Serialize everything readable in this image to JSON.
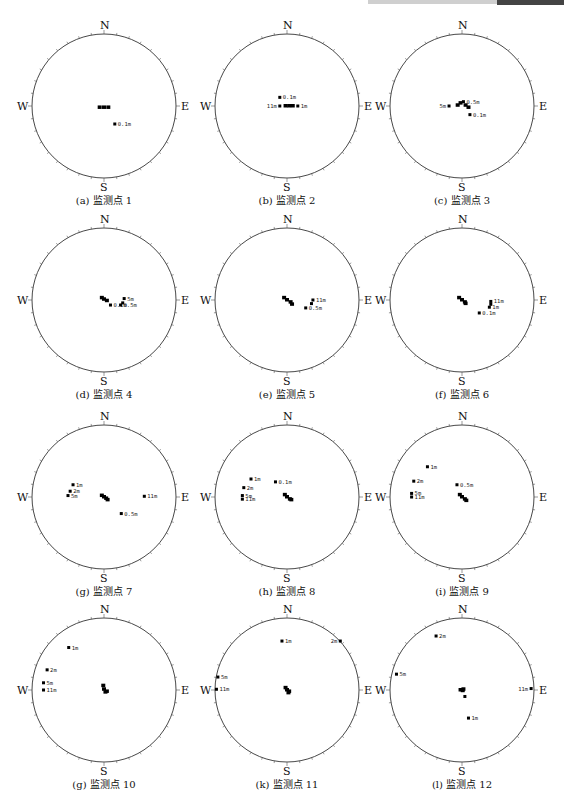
{
  "header": {
    "decoration": "chapter-header-bar"
  },
  "chart_data": [
    {
      "type": "scatter",
      "title": "(a) 监测点 1",
      "subplot": "a",
      "compass": [
        "N",
        "E",
        "S",
        "W"
      ],
      "cluster": [
        [
          -0.06,
          -0.02
        ],
        [
          0.0,
          -0.02
        ],
        [
          0.06,
          -0.02
        ]
      ],
      "points": [
        {
          "label": "0.1m",
          "x": 0.15,
          "y": -0.25
        }
      ]
    },
    {
      "type": "scatter",
      "title": "(b) 监测点 2",
      "subplot": "b",
      "compass": [
        "N",
        "E",
        "S",
        "W"
      ],
      "cluster": [
        [
          -0.02,
          0.0
        ],
        [
          0.03,
          0.0
        ],
        [
          0.08,
          0.0
        ]
      ],
      "points": [
        {
          "label": "0.1m",
          "x": -0.1,
          "y": 0.12
        },
        {
          "label": "11m",
          "x": -0.1,
          "y": 0.0,
          "anchor": "left"
        },
        {
          "label": "1m",
          "x": 0.15,
          "y": 0.0
        }
      ]
    },
    {
      "type": "scatter",
      "title": "(c) 监测点 3",
      "subplot": "c",
      "compass": [
        "N",
        "E",
        "S",
        "W"
      ],
      "cluster": [
        [
          -0.02,
          0.04
        ],
        [
          -0.06,
          0.01
        ],
        [
          0.05,
          0.01
        ],
        [
          0.09,
          -0.02
        ]
      ],
      "points": [
        {
          "label": "0.5m",
          "x": 0.02,
          "y": 0.06
        },
        {
          "label": "5m",
          "x": -0.18,
          "y": 0.0,
          "anchor": "left"
        },
        {
          "label": "0.1m",
          "x": 0.11,
          "y": -0.12
        }
      ]
    },
    {
      "type": "scatter",
      "title": "(d) 监测点 4",
      "subplot": "d",
      "compass": [
        "N",
        "E",
        "S",
        "W"
      ],
      "cluster": [
        [
          -0.03,
          0.03
        ],
        [
          0.0,
          0.01
        ],
        [
          0.04,
          -0.01
        ]
      ],
      "points": [
        {
          "label": "5m",
          "x": 0.28,
          "y": 0.02
        },
        {
          "label": "0.1m",
          "x": 0.09,
          "y": -0.07
        },
        {
          "label": "0.5m",
          "x": 0.23,
          "y": -0.07
        },
        {
          "label": "",
          "x": 0.26,
          "y": -0.04
        }
      ]
    },
    {
      "type": "scatter",
      "title": "(e) 监测点 5",
      "subplot": "e",
      "compass": [
        "N",
        "E",
        "S",
        "W"
      ],
      "cluster": [
        [
          -0.04,
          0.03
        ],
        [
          0.0,
          0.0
        ],
        [
          0.05,
          -0.03
        ],
        [
          0.07,
          -0.06
        ]
      ],
      "points": [
        {
          "label": "11m",
          "x": 0.36,
          "y": 0.0
        },
        {
          "label": "",
          "x": 0.34,
          "y": -0.05
        },
        {
          "label": "0.5m",
          "x": 0.26,
          "y": -0.11
        }
      ]
    },
    {
      "type": "scatter",
      "title": "(f) 监测点 6",
      "subplot": "f",
      "compass": [
        "N",
        "E",
        "S",
        "W"
      ],
      "cluster": [
        [
          -0.04,
          0.03
        ],
        [
          0.0,
          0.0
        ],
        [
          0.04,
          -0.03
        ],
        [
          0.05,
          -0.05
        ]
      ],
      "points": [
        {
          "label": "11m",
          "x": 0.4,
          "y": -0.02
        },
        {
          "label": "",
          "x": 0.4,
          "y": -0.06
        },
        {
          "label": "1m",
          "x": 0.38,
          "y": -0.1
        },
        {
          "label": "0.1m",
          "x": 0.24,
          "y": -0.18
        }
      ]
    },
    {
      "type": "scatter",
      "title": "(g) 监测点 7",
      "subplot": "g",
      "compass": [
        "N",
        "E",
        "S",
        "W"
      ],
      "cluster": [
        [
          -0.03,
          0.02
        ],
        [
          0.0,
          0.0
        ],
        [
          0.03,
          -0.02
        ],
        [
          0.05,
          -0.04
        ]
      ],
      "points": [
        {
          "label": "1m",
          "x": -0.43,
          "y": 0.17
        },
        {
          "label": "2m",
          "x": -0.47,
          "y": 0.08
        },
        {
          "label": "5m",
          "x": -0.5,
          "y": 0.02
        },
        {
          "label": "11m",
          "x": 0.56,
          "y": 0.01
        },
        {
          "label": "0.5m",
          "x": 0.24,
          "y": -0.23
        }
      ]
    },
    {
      "type": "scatter",
      "title": "(h) 监测点 8",
      "subplot": "h",
      "compass": [
        "N",
        "E",
        "S",
        "W"
      ],
      "cluster": [
        [
          -0.03,
          0.03
        ],
        [
          0.0,
          0.0
        ],
        [
          0.04,
          -0.03
        ],
        [
          0.06,
          -0.04
        ]
      ],
      "points": [
        {
          "label": "1m",
          "x": -0.5,
          "y": 0.25
        },
        {
          "label": "0.1m",
          "x": -0.16,
          "y": 0.21
        },
        {
          "label": "2m",
          "x": -0.6,
          "y": 0.13
        },
        {
          "label": "5m",
          "x": -0.62,
          "y": 0.02
        },
        {
          "label": "11m",
          "x": -0.62,
          "y": -0.03
        }
      ]
    },
    {
      "type": "scatter",
      "title": "(i) 监测点 9",
      "subplot": "i",
      "compass": [
        "N",
        "E",
        "S",
        "W"
      ],
      "cluster": [
        [
          -0.03,
          0.03
        ],
        [
          0.0,
          0.0
        ],
        [
          0.04,
          -0.03
        ],
        [
          0.06,
          -0.05
        ]
      ],
      "points": [
        {
          "label": "1m",
          "x": -0.48,
          "y": 0.42
        },
        {
          "label": "2m",
          "x": -0.67,
          "y": 0.22
        },
        {
          "label": "0.5m",
          "x": -0.07,
          "y": 0.17
        },
        {
          "label": "5m",
          "x": -0.7,
          "y": 0.05
        },
        {
          "label": "11m",
          "x": -0.7,
          "y": 0.0
        }
      ]
    },
    {
      "type": "scatter",
      "title": "(g) 监测点 10",
      "subplot": "j",
      "compass": [
        "N",
        "E",
        "S",
        "W"
      ],
      "cluster": [
        [
          -0.01,
          0.06
        ],
        [
          0.0,
          0.01
        ],
        [
          0.02,
          -0.03
        ],
        [
          0.04,
          -0.02
        ]
      ],
      "points": [
        {
          "label": "1m",
          "x": -0.49,
          "y": 0.59
        },
        {
          "label": "2m",
          "x": -0.79,
          "y": 0.28
        },
        {
          "label": "5m",
          "x": -0.84,
          "y": 0.1
        },
        {
          "label": "11m",
          "x": -0.84,
          "y": 0.0
        }
      ]
    },
    {
      "type": "scatter",
      "title": "(k) 监测点 11",
      "subplot": "k",
      "compass": [
        "N",
        "E",
        "S",
        "W"
      ],
      "cluster": [
        [
          -0.02,
          0.03
        ],
        [
          0.0,
          0.0
        ],
        [
          0.02,
          -0.04
        ],
        [
          0.03,
          -0.02
        ]
      ],
      "points": [
        {
          "label": "1m",
          "x": -0.07,
          "y": 0.68
        },
        {
          "label": "2m",
          "x": 0.74,
          "y": 0.68,
          "anchor": "left"
        },
        {
          "label": "5m",
          "x": -0.96,
          "y": 0.18
        },
        {
          "label": "11m",
          "x": -0.98,
          "y": 0.01
        }
      ]
    },
    {
      "type": "scatter",
      "title": "(l) 监测点 12",
      "subplot": "l",
      "compass": [
        "N",
        "E",
        "S",
        "W"
      ],
      "cluster": [
        [
          -0.02,
          0.0
        ],
        [
          0.01,
          -0.01
        ],
        [
          0.02,
          0.01
        ]
      ],
      "points": [
        {
          "label": "2m",
          "x": -0.36,
          "y": 0.75
        },
        {
          "label": "5m",
          "x": -0.91,
          "y": 0.22
        },
        {
          "label": "11m",
          "x": 0.96,
          "y": 0.02,
          "anchor": "left"
        },
        {
          "label": "",
          "x": 0.04,
          "y": -0.09
        },
        {
          "label": "1m",
          "x": 0.09,
          "y": -0.39
        }
      ]
    }
  ]
}
